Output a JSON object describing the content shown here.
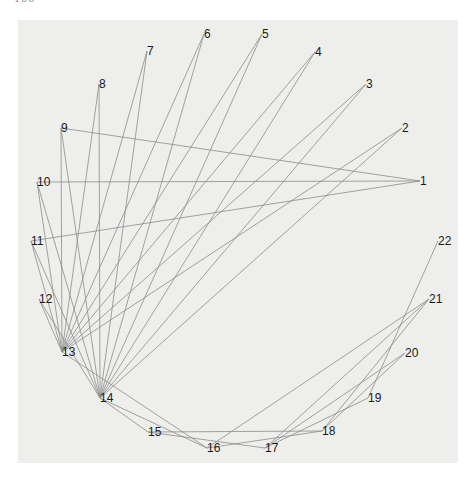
{
  "header": {
    "page_number": "106",
    "running_title": "· · · · · · · · · · ·"
  },
  "figure": {
    "type": "circular-graph",
    "background": "#eeeeec",
    "edge_color": "#8c8c8c",
    "nodes": [
      {
        "id": "1",
        "x": 420,
        "y": 181
      },
      {
        "id": "2",
        "x": 402,
        "y": 128
      },
      {
        "id": "3",
        "x": 366,
        "y": 84
      },
      {
        "id": "4",
        "x": 315,
        "y": 52
      },
      {
        "id": "5",
        "x": 262,
        "y": 34
      },
      {
        "id": "6",
        "x": 204,
        "y": 34
      },
      {
        "id": "7",
        "x": 147,
        "y": 51
      },
      {
        "id": "8",
        "x": 99,
        "y": 84
      },
      {
        "id": "9",
        "x": 61,
        "y": 128
      },
      {
        "id": "10",
        "x": 37,
        "y": 182
      },
      {
        "id": "11",
        "x": 31,
        "y": 241
      },
      {
        "id": "12",
        "x": 39,
        "y": 299
      },
      {
        "id": "13",
        "x": 62,
        "y": 352
      },
      {
        "id": "14",
        "x": 100,
        "y": 398
      },
      {
        "id": "15",
        "x": 148,
        "y": 432
      },
      {
        "id": "16",
        "x": 207,
        "y": 448
      },
      {
        "id": "17",
        "x": 265,
        "y": 448
      },
      {
        "id": "18",
        "x": 322,
        "y": 431
      },
      {
        "id": "19",
        "x": 368,
        "y": 398
      },
      {
        "id": "20",
        "x": 405,
        "y": 353
      },
      {
        "id": "21",
        "x": 429,
        "y": 299
      },
      {
        "id": "22",
        "x": 438,
        "y": 241
      }
    ],
    "edges": [
      [
        "1",
        "9"
      ],
      [
        "1",
        "10"
      ],
      [
        "1",
        "11"
      ],
      [
        "2",
        "13"
      ],
      [
        "2",
        "14"
      ],
      [
        "3",
        "13"
      ],
      [
        "3",
        "14"
      ],
      [
        "4",
        "13"
      ],
      [
        "4",
        "14"
      ],
      [
        "5",
        "13"
      ],
      [
        "5",
        "14"
      ],
      [
        "6",
        "13"
      ],
      [
        "6",
        "14"
      ],
      [
        "7",
        "13"
      ],
      [
        "7",
        "14"
      ],
      [
        "8",
        "13"
      ],
      [
        "8",
        "14"
      ],
      [
        "9",
        "13"
      ],
      [
        "9",
        "14"
      ],
      [
        "10",
        "13"
      ],
      [
        "10",
        "14"
      ],
      [
        "11",
        "13"
      ],
      [
        "11",
        "14"
      ],
      [
        "12",
        "13"
      ],
      [
        "12",
        "14"
      ],
      [
        "14",
        "15"
      ],
      [
        "14",
        "16"
      ],
      [
        "13",
        "16"
      ],
      [
        "15",
        "18"
      ],
      [
        "15",
        "17"
      ],
      [
        "16",
        "18"
      ],
      [
        "17",
        "20"
      ],
      [
        "17",
        "21"
      ],
      [
        "16",
        "21"
      ],
      [
        "18",
        "20"
      ],
      [
        "17",
        "19"
      ],
      [
        "19",
        "22"
      ],
      [
        "18",
        "21"
      ]
    ]
  }
}
